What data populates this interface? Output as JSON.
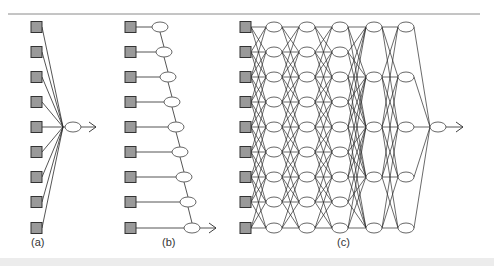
{
  "figure": {
    "colors": {
      "rule": "#8a8a8a",
      "line": "#2a2a2a",
      "input_fill": "#9a9a9a",
      "input_stroke": "#333333",
      "node_fill": "#ffffff",
      "node_stroke": "#555555",
      "band": "#ececec"
    },
    "rows_y": [
      27,
      52,
      77,
      102,
      127,
      152,
      177,
      202,
      228
    ],
    "panels": [
      {
        "id": "a",
        "label": "(a)",
        "label_x": 31,
        "description": "single neuron: 9 inputs converge to one output node",
        "input_x": 31,
        "converge": {
          "x": 63,
          "y": 127
        },
        "output_node": {
          "cx": 73,
          "cy": 127
        },
        "arrow_end_x": 96
      },
      {
        "id": "b",
        "label": "(b)",
        "label_x": 162,
        "description": "chain: each input feeds a node, nodes chained downward",
        "input_x": 125,
        "node_cx_start": 160,
        "node_cx_step": 4,
        "arrow_end_x": 216
      },
      {
        "id": "c",
        "label": "(c)",
        "label_x": 337,
        "description": "deep network: 9 inputs, 3 layers of 9 nodes, 2 layers of 5 nodes, 1 output",
        "input_x": 240,
        "layers": [
          {
            "cx": 274,
            "count": 9
          },
          {
            "cx": 307,
            "count": 9
          },
          {
            "cx": 340,
            "count": 9
          },
          {
            "cx": 374,
            "count": 5
          },
          {
            "cx": 406,
            "count": 5
          }
        ],
        "five_rows_y": [
          27,
          77,
          127,
          177,
          228
        ],
        "output_node": {
          "cx": 438,
          "cy": 127
        },
        "arrow_end_x": 463
      }
    ]
  }
}
